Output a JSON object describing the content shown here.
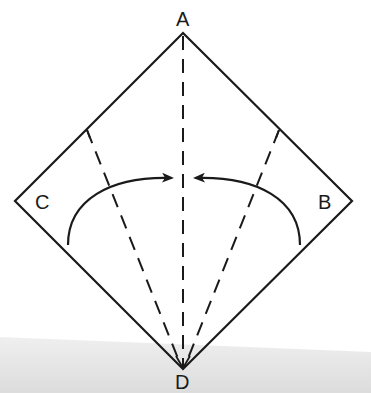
{
  "diagram": {
    "type": "origami-fold-instruction",
    "shape": "square rotated 45 degrees (diamond)",
    "colors": {
      "line": "#1a1a1a",
      "background": "#ffffff",
      "bottom_band": "#e6e6e6"
    },
    "vertices": {
      "top": {
        "label": "A",
        "x": 183,
        "y": 33
      },
      "left": {
        "label": "C",
        "x": 15,
        "y": 201
      },
      "right": {
        "label": "B",
        "x": 352,
        "y": 201
      },
      "bottom": {
        "label": "D",
        "x": 183,
        "y": 369
      }
    },
    "fold_lines": [
      {
        "name": "center-crease",
        "style": "dashed",
        "from": "A",
        "to": "D"
      },
      {
        "name": "left-fold-line",
        "style": "dashed",
        "from_edge": "A-C",
        "to": "D"
      },
      {
        "name": "right-fold-line",
        "style": "dashed",
        "from_edge": "A-B",
        "to": "D"
      }
    ],
    "arrows": [
      {
        "name": "left-fold-arrow",
        "direction": "fold C toward center"
      },
      {
        "name": "right-fold-arrow",
        "direction": "fold B toward center"
      }
    ]
  }
}
